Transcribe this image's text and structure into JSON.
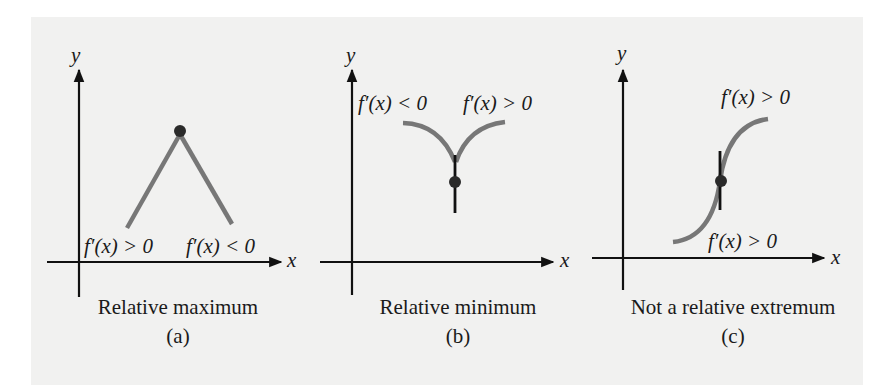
{
  "figure": {
    "colors": {
      "background": "#f1f1f0",
      "axis": "#111111",
      "curve": "#777777",
      "point": "#2a2a2a",
      "text": "#1a1a1a"
    },
    "panels": [
      {
        "id": "a",
        "x_axis_label": "x",
        "y_axis_label": "y",
        "left_label": "f′(x) > 0",
        "right_label": "f′(x) < 0",
        "caption": "Relative maximum",
        "sub_label": "(a)"
      },
      {
        "id": "b",
        "x_axis_label": "x",
        "y_axis_label": "y",
        "left_label": "f′(x) < 0",
        "right_label": "f′(x) > 0",
        "caption": "Relative minimum",
        "sub_label": "(b)"
      },
      {
        "id": "c",
        "x_axis_label": "x",
        "y_axis_label": "y",
        "top_label": "f′(x) > 0",
        "bottom_label": "f′(x) > 0",
        "caption": "Not a relative extremum",
        "sub_label": "(c)"
      }
    ]
  }
}
